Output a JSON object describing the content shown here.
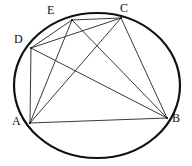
{
  "figure": {
    "type": "circle-geometry-diagram",
    "canvas": {
      "width": 192,
      "height": 166
    },
    "background_color": "#ffffff",
    "stroke_colors": {
      "circle": "#111111",
      "chord": "#3a3a3a",
      "label": "#111111"
    },
    "circle": {
      "name": "circumscribed-circle",
      "center_x": 97,
      "center_y": 85.5,
      "radius_x": 83,
      "radius_y": 72.5,
      "stroke_width": 2.2
    },
    "points": [
      {
        "id": "A",
        "label": "A",
        "x": 30,
        "y": 123,
        "label_x": 12,
        "label_y": 115
      },
      {
        "id": "B",
        "label": "B",
        "x": 167,
        "y": 118,
        "label_x": 172,
        "label_y": 112
      },
      {
        "id": "C",
        "label": "C",
        "x": 121,
        "y": 18,
        "label_x": 120,
        "label_y": 2
      },
      {
        "id": "D",
        "label": "D",
        "x": 31,
        "y": 48,
        "label_x": 14,
        "label_y": 33
      },
      {
        "id": "E",
        "label": "E",
        "x": 72,
        "y": 20,
        "label_x": 47,
        "label_y": 4
      }
    ],
    "chords": [
      {
        "id": "DE",
        "from": "D",
        "to": "E",
        "label": "D-E"
      },
      {
        "id": "DC",
        "from": "D",
        "to": "C",
        "label": "D-C"
      },
      {
        "id": "DA",
        "from": "D",
        "to": "A",
        "label": "D-A"
      },
      {
        "id": "DB",
        "from": "D",
        "to": "B",
        "label": "D-B"
      },
      {
        "id": "EC",
        "from": "E",
        "to": "C",
        "label": "E-C"
      },
      {
        "id": "EA",
        "from": "E",
        "to": "A",
        "label": "E-A"
      },
      {
        "id": "EB",
        "from": "E",
        "to": "B",
        "label": "E-B"
      },
      {
        "id": "CA",
        "from": "C",
        "to": "A",
        "label": "C-A"
      },
      {
        "id": "CB",
        "from": "C",
        "to": "B",
        "label": "C-B"
      },
      {
        "id": "AB",
        "from": "A",
        "to": "B",
        "label": "A-B"
      }
    ]
  }
}
